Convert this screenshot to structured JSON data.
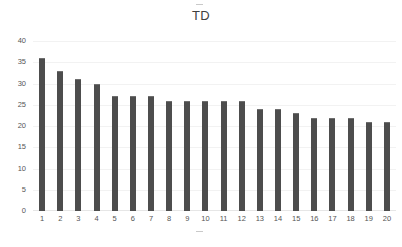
{
  "chart_data": {
    "type": "bar",
    "title": "TD",
    "xlabel": "",
    "ylabel": "",
    "categories": [
      "1",
      "2",
      "3",
      "4",
      "5",
      "6",
      "7",
      "8",
      "9",
      "10",
      "11",
      "12",
      "13",
      "14",
      "15",
      "16",
      "17",
      "18",
      "19",
      "20"
    ],
    "values": [
      36,
      33,
      31,
      30,
      27,
      27,
      27,
      26,
      26,
      26,
      26,
      26,
      24,
      24,
      23,
      22,
      22,
      22,
      21,
      21
    ],
    "ylim": [
      0,
      40
    ],
    "y_ticks": [
      0,
      5,
      10,
      15,
      20,
      25,
      30,
      35,
      40
    ],
    "y_tick_labels": [
      "0",
      "5",
      "10",
      "15",
      "20",
      "25",
      "30",
      "35",
      "40"
    ],
    "grid": true,
    "legend": false,
    "bar_color": "#4d4d4d",
    "grid_color": "#f2f2f2",
    "background_color": "#ffffff",
    "text_color": "#555555",
    "title_color": "#3f3f3f"
  },
  "artifacts": {
    "title_dash": "",
    "axis_dash": ""
  }
}
